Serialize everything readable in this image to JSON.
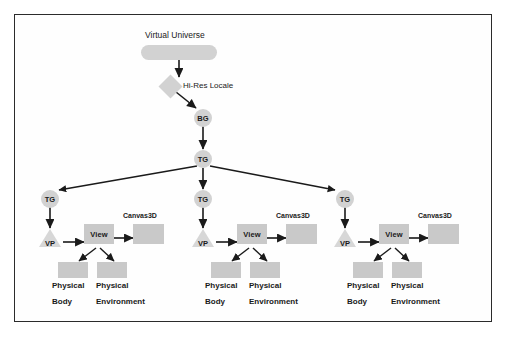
{
  "diagram": {
    "title_text": "Virtual Universe",
    "locale_text": "Hi-Res Locale",
    "bg_text": "BG",
    "tg_root_text": "TG",
    "colors": {
      "node_fill": "#d2d2d2",
      "rect_fill": "#c9c9c9",
      "edge": "#1a1a1a",
      "frame_border": "#2b2b2b",
      "page_background": "#ffffff"
    },
    "branches": [
      {
        "tg_text": "TG",
        "vp_text": "VP",
        "view_text": "View",
        "canvas_text": "Canvas3D",
        "body_line1": "Physical",
        "body_line2": "Body",
        "env_line1": "Physical",
        "env_line2": "Environment"
      },
      {
        "tg_text": "TG",
        "vp_text": "VP",
        "view_text": "View",
        "canvas_text": "Canvas3D",
        "body_line1": "Physical",
        "body_line2": "Body",
        "env_line1": "Physical",
        "env_line2": "Environment"
      },
      {
        "tg_text": "TG",
        "vp_text": "VP",
        "view_text": "View",
        "canvas_text": "Canvas3D",
        "body_line1": "Physical",
        "body_line2": "Body",
        "env_line1": "Physical",
        "env_line2": "Environment"
      }
    ],
    "middle_tg_text": "TG"
  }
}
